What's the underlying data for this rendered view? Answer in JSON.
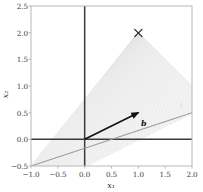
{
  "chart_data": {
    "type": "scatter",
    "title": "",
    "xlabel": "x₁",
    "ylabel": "x₂",
    "xlim": [
      -1.0,
      2.0
    ],
    "ylim": [
      -0.5,
      2.5
    ],
    "xticks": [
      "−1.0",
      "−0.5",
      "0.0",
      "0.5",
      "1.0",
      "1.5",
      "2.0"
    ],
    "xtick_values": [
      -1.0,
      -0.5,
      0.0,
      0.5,
      1.0,
      1.5,
      2.0
    ],
    "yticks": [
      "−0.5",
      "0.0",
      "0.5",
      "1.0",
      "1.5",
      "2.0",
      "2.5"
    ],
    "ytick_values": [
      -0.5,
      0.0,
      0.5,
      1.0,
      1.5,
      2.0,
      2.5
    ],
    "grid": false,
    "legend": null,
    "series": [
      {
        "name": "b",
        "type": "vector-arrow",
        "label": "b",
        "color": "#111111",
        "from": [
          0.0,
          0.0
        ],
        "to": [
          1.0,
          0.5
        ],
        "label_position": [
          1.05,
          0.32
        ]
      },
      {
        "name": "x-marker",
        "type": "marker",
        "marker": "x",
        "color": "#2b2b2b",
        "points": [
          [
            1.0,
            2.0
          ]
        ]
      },
      {
        "name": "constraint-line",
        "type": "line",
        "color": "#9a9a9a",
        "slope": 0.5,
        "intercept": 0.0,
        "points": [
          [
            -1.0,
            -0.5
          ],
          [
            2.0,
            1.0
          ]
        ],
        "label": "l",
        "label_position": [
          1.78,
          0.62
        ]
      },
      {
        "name": "ray-fan",
        "type": "fan",
        "color": "#c8c8c8",
        "apex": [
          1.0,
          2.0
        ],
        "ray_count": 60,
        "sweep_from": [
          -1.0,
          -0.5
        ],
        "sweep_to": [
          2.0,
          1.0
        ],
        "description": "cone of rays from apex to points along the line"
      },
      {
        "name": "zero-lines",
        "type": "axhline-axvline",
        "color": "#3a3a3a",
        "x": 0.0,
        "y": 0.0
      }
    ]
  },
  "figure": {
    "background": "#ffffff",
    "plot_background": "#ffffff",
    "spine_color": "#b8b8b8",
    "tick_color": "#3a3a3a",
    "accent_dark": "#111111",
    "accent_gray": "#9a9a9a",
    "fan_gray": "#c8c8c8"
  }
}
